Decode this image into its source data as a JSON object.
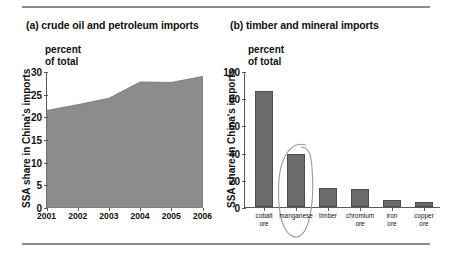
{
  "figure": {
    "rules": [
      "top-rule",
      "bottom-rule"
    ]
  },
  "panel_a": {
    "title": "(a) crude oil and petroleum imports",
    "unit_label": "percent\nof total",
    "unit_line1": "percent",
    "unit_line2": "of total",
    "axis_title": "SSA share in China's imports"
  },
  "panel_b": {
    "title": "(b) timber and mineral imports",
    "unit_line1": "percent",
    "unit_line2": "of total",
    "axis_title": "SSA share in China's imports",
    "annotation": "hand-drawn ellipse around manganese bar"
  },
  "colors": {
    "fill": "#8c8c8c",
    "bar": "#6b6b6b",
    "bar_edge": "#4d4d4d",
    "axis": "#5a5a5a",
    "rule": "#8d8d8d",
    "text": "#111111",
    "annotation": "#9a9a9a"
  },
  "chart_data": [
    {
      "type": "area",
      "title": "(a) crude oil and petroleum imports",
      "subtitle": "percent of total",
      "xlabel": "",
      "ylabel": "SSA share in China's imports",
      "categories": [
        "2001",
        "2002",
        "2003",
        "2004",
        "2005",
        "2006"
      ],
      "x": [
        2001,
        2002,
        2003,
        2004,
        2005,
        2006
      ],
      "values": [
        21.5,
        22.8,
        24.2,
        27.8,
        27.7,
        29.0
      ],
      "ylim": [
        0,
        30
      ],
      "yticks": [
        0,
        5,
        10,
        15,
        20,
        25,
        30
      ],
      "grid": false,
      "legend": "none"
    },
    {
      "type": "bar",
      "title": "(b) timber and mineral imports",
      "subtitle": "percent of total",
      "xlabel": "",
      "ylabel": "SSA share in China's imports",
      "categories": [
        "cobalt ore",
        "manganese",
        "timber",
        "chromium ore",
        "iron ore",
        "copper ore"
      ],
      "category_lines": [
        [
          "cobalt",
          "ore"
        ],
        [
          "manganese",
          ""
        ],
        [
          "timber",
          ""
        ],
        [
          "chromium",
          "ore"
        ],
        [
          "iron",
          "ore"
        ],
        [
          "copper",
          "ore"
        ]
      ],
      "values": [
        85,
        39,
        14,
        13,
        5,
        4
      ],
      "ylim": [
        0,
        100
      ],
      "yticks": [
        0,
        20,
        40,
        60,
        80,
        100
      ],
      "grid": false,
      "legend": "none",
      "annotations": [
        {
          "type": "ellipse",
          "target": "manganese",
          "style": "hand-drawn"
        }
      ]
    }
  ]
}
